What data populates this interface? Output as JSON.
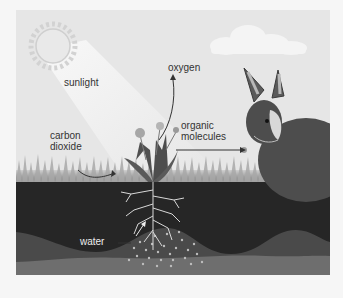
{
  "diagram": {
    "type": "photosynthesis-illustration",
    "labels": {
      "sunlight": "sunlight",
      "oxygen": "oxygen",
      "carbon_dioxide_line1": "carbon",
      "carbon_dioxide_line2": "dioxide",
      "organic_molecules_line1": "organic",
      "organic_molecules_line2": "molecules",
      "water": "water"
    },
    "elements": [
      "sun",
      "sunbeam",
      "cloud",
      "dandelion-plant",
      "roots",
      "rabbit",
      "grass",
      "soil-layers",
      "water-particles"
    ],
    "colors": {
      "sky": "#e6e6e6",
      "sun": "#cfcfcf",
      "cloud": "#f4f4f4",
      "grass": "#9a9a9a",
      "topsoil": "#262626",
      "subsoil": "#4a4a4a",
      "bedrock": "#6e6e6e",
      "rabbit": "#4d4d4d",
      "plant": "#5a5a5a",
      "roots": "#d8d8d8"
    }
  }
}
